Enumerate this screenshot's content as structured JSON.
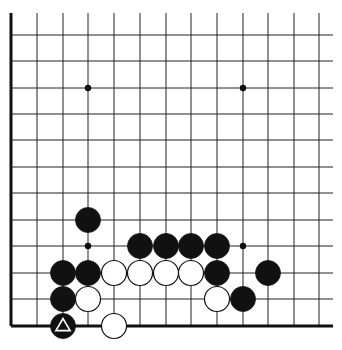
{
  "diagram": {
    "board": {
      "columns_x": [
        11,
        37,
        63,
        88,
        114,
        140,
        166,
        191,
        217,
        243,
        268,
        294,
        319
      ],
      "rows_y": [
        35,
        61,
        88,
        114,
        140,
        167,
        193,
        220,
        246,
        273,
        299,
        326
      ],
      "top_open_y": 13,
      "right_open_x": 333,
      "left_edge": true,
      "bottom_edge": true,
      "line_color": "#222222",
      "edge_color": "#111111",
      "stone_radius": 12.5
    },
    "star_points": [
      {
        "col": 3,
        "row": 2
      },
      {
        "col": 9,
        "row": 2
      },
      {
        "col": 3,
        "row": 8
      },
      {
        "col": 9,
        "row": 8
      }
    ],
    "stones": [
      {
        "color": "black",
        "col": 3,
        "row": 7
      },
      {
        "color": "black",
        "col": 5,
        "row": 8
      },
      {
        "color": "black",
        "col": 6,
        "row": 8
      },
      {
        "color": "black",
        "col": 7,
        "row": 8
      },
      {
        "color": "black",
        "col": 8,
        "row": 8
      },
      {
        "color": "black",
        "col": 2,
        "row": 9
      },
      {
        "color": "black",
        "col": 3,
        "row": 9
      },
      {
        "color": "white",
        "col": 4,
        "row": 9
      },
      {
        "color": "white",
        "col": 5,
        "row": 9
      },
      {
        "color": "white",
        "col": 6,
        "row": 9
      },
      {
        "color": "white",
        "col": 7,
        "row": 9
      },
      {
        "color": "black",
        "col": 8,
        "row": 9
      },
      {
        "color": "black",
        "col": 10,
        "row": 9
      },
      {
        "color": "black",
        "col": 2,
        "row": 10
      },
      {
        "color": "white",
        "col": 3,
        "row": 10
      },
      {
        "color": "white",
        "col": 8,
        "row": 10
      },
      {
        "color": "black",
        "col": 9,
        "row": 10
      },
      {
        "color": "black",
        "col": 2,
        "row": 11,
        "marker": "triangle"
      },
      {
        "color": "white",
        "col": 4,
        "row": 11
      }
    ]
  }
}
